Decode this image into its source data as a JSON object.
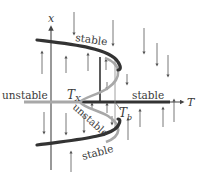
{
  "diagram": {
    "type": "bifurcation-diagram",
    "axes": {
      "vertical_label": "x",
      "horizontal_label": "T"
    },
    "points": {
      "Tx": {
        "label": "T",
        "subscript": "X"
      },
      "Tb": {
        "label": "T",
        "subscript": "b"
      }
    },
    "branch_labels": {
      "upper_stable": "stable",
      "axis_left_unstable": "unstable",
      "axis_right_stable": "stable",
      "middle_unstable": "unstable",
      "lower_stable": "stable"
    },
    "colors": {
      "stable_branch": "#333333",
      "unstable_branch": "#a8a8a8",
      "axis": "#444444",
      "flow_arrow": "#555555",
      "text": "#3a3a3a"
    },
    "flow_arrows": {
      "down": [
        {
          "x": 74,
          "y1": 12,
          "y2": 34
        },
        {
          "x": 113,
          "y1": 20,
          "y2": 45
        },
        {
          "x": 144,
          "y1": 28,
          "y2": 53
        },
        {
          "x": 157,
          "y1": 43,
          "y2": 65
        },
        {
          "x": 168,
          "y1": 55,
          "y2": 76
        },
        {
          "x": 127,
          "y1": 74,
          "y2": 84
        },
        {
          "x": 44,
          "y1": 112,
          "y2": 133
        },
        {
          "x": 66,
          "y1": 113,
          "y2": 134
        },
        {
          "x": 84,
          "y1": 114,
          "y2": 132
        },
        {
          "x": 107,
          "y1": 82,
          "y2": 89
        },
        {
          "x": 112,
          "y1": 116,
          "y2": 124
        }
      ],
      "up": [
        {
          "x": 42,
          "y1": 74,
          "y2": 52
        },
        {
          "x": 66,
          "y1": 73,
          "y2": 57
        },
        {
          "x": 88,
          "y1": 71,
          "y2": 54
        },
        {
          "x": 106,
          "y1": 70,
          "y2": 60
        },
        {
          "x": 92,
          "y1": 110,
          "y2": 104
        },
        {
          "x": 107,
          "y1": 113,
          "y2": 104
        },
        {
          "x": 71,
          "y1": 172,
          "y2": 152
        },
        {
          "x": 128,
          "y1": 140,
          "y2": 119
        },
        {
          "x": 140,
          "y1": 127,
          "y2": 110
        },
        {
          "x": 163,
          "y1": 127,
          "y2": 108
        },
        {
          "x": 174,
          "y1": 122,
          "y2": 100
        }
      ]
    }
  }
}
